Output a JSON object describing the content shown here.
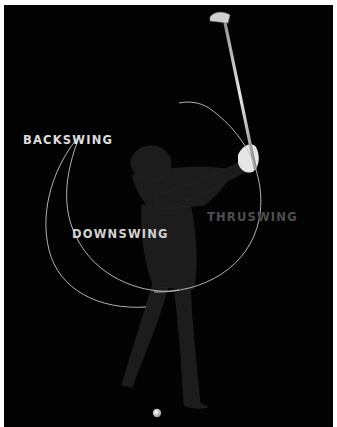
{
  "labels": {
    "backswing": "BACKSWING",
    "downswing": "DOWNSWING",
    "thruswing": "THRUSWING"
  },
  "colors": {
    "background": "#030303",
    "border": "#ffffff",
    "arc": "#bfbfbf",
    "label_bright": "#dedede",
    "label_dim": "#4e4e4e",
    "figure": "#1e1e1e",
    "glove": "#e8e8e8",
    "ball": "#f2f2f2"
  }
}
